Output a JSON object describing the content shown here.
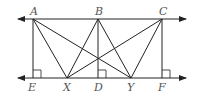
{
  "diagram": {
    "type": "geometry",
    "stroke_color": "#222222",
    "label_color": "#555555",
    "lines": {
      "top": {
        "y": 19,
        "x_start": 18,
        "x_end": 186,
        "arrows": "both"
      },
      "bottom": {
        "y": 78,
        "x_start": 18,
        "x_end": 186,
        "arrows": "both"
      }
    },
    "points": {
      "A": {
        "label": "A",
        "x": 33,
        "y": 19
      },
      "B": {
        "label": "B",
        "x": 98,
        "y": 19
      },
      "C": {
        "label": "C",
        "x": 162,
        "y": 19
      },
      "E": {
        "label": "E",
        "x": 33,
        "y": 78
      },
      "X": {
        "label": "X",
        "x": 67,
        "y": 78
      },
      "D": {
        "label": "D",
        "x": 98,
        "y": 78
      },
      "Y": {
        "label": "Y",
        "x": 131,
        "y": 78
      },
      "F": {
        "label": "F",
        "x": 162,
        "y": 78
      }
    },
    "segments": [
      [
        "A",
        "E"
      ],
      [
        "B",
        "D"
      ],
      [
        "C",
        "F"
      ],
      [
        "A",
        "X"
      ],
      [
        "A",
        "Y"
      ],
      [
        "B",
        "X"
      ],
      [
        "B",
        "Y"
      ],
      [
        "C",
        "X"
      ],
      [
        "C",
        "Y"
      ]
    ],
    "right_angles": [
      "E",
      "D",
      "F"
    ]
  }
}
